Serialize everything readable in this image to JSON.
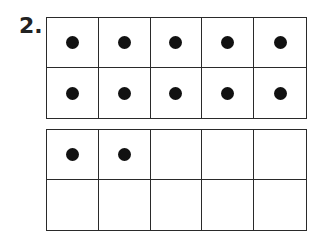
{
  "problem": {
    "number": "2.",
    "frames": [
      {
        "name": "ten-frame-1",
        "filled": [
          1,
          1,
          1,
          1,
          1,
          1,
          1,
          1,
          1,
          1
        ]
      },
      {
        "name": "ten-frame-2",
        "filled": [
          1,
          1,
          0,
          0,
          0,
          0,
          0,
          0,
          0,
          0
        ]
      }
    ],
    "dot_color": "#111111"
  }
}
